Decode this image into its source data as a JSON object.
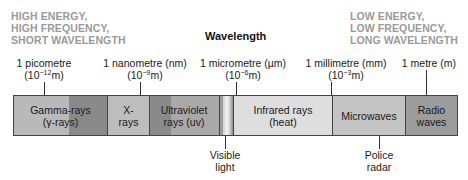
{
  "corners": {
    "left": [
      "HIGH ENERGY,",
      "HIGH FREQUENCY,",
      "SHORT WAVELENGTH"
    ],
    "right": [
      "LOW ENERGY,",
      "LOW FREQUENCY,",
      "LONG WAVELENGTH"
    ]
  },
  "title": "Wavelength",
  "ticks": [
    {
      "name": "1 picometre",
      "base": "(10",
      "exp": "−12",
      "unit": "m)"
    },
    {
      "name": "1 nanometre (nm)",
      "base": "(10",
      "exp": "−9",
      "unit": "m)"
    },
    {
      "name": "1 micrometre (µm)",
      "base": "(10",
      "exp": "−6",
      "unit": "m)"
    },
    {
      "name": "1 millimetre (mm)",
      "base": "(10",
      "exp": "−3",
      "unit": "m)"
    },
    {
      "name": "1 metre (m)"
    }
  ],
  "bands": [
    {
      "line1": "Gamma-rays",
      "line2": "(γ-rays)"
    },
    {
      "line1": "X-",
      "line2": "rays"
    },
    {
      "line1": "Ultraviolet",
      "line2": "rays (uv)"
    },
    {
      "line1": "Infrared rays",
      "line2": "(heat)"
    },
    {
      "line1": "Microwaves"
    },
    {
      "line1": "Radio",
      "line2": "waves"
    }
  ],
  "callouts": [
    {
      "line1": "Visible",
      "line2": "light"
    },
    {
      "line1": "Police",
      "line2": "radar"
    }
  ],
  "colors": {
    "gamma": "#b9b9b9",
    "overlap": "#8a8a8a",
    "xray": "#bdbdbd",
    "uv": "#a9a9a9",
    "visible": "#e6e6e6",
    "infrared": "#dedede",
    "microwave": "#c4c4c4",
    "radio": "#9c9c9c",
    "corner_text": "#9a9a9a"
  }
}
